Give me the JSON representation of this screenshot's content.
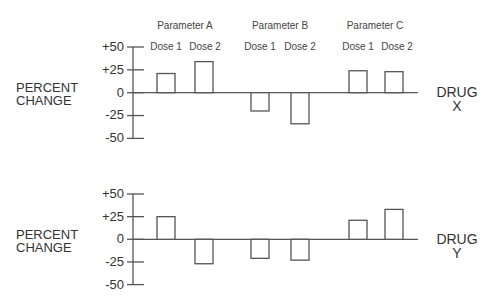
{
  "chart_data": [
    {
      "type": "bar",
      "title": "DRUG X",
      "panel_label": "DRUG\nX",
      "ylabel": "PERCENT\nCHANGE",
      "xlabel": "",
      "groups": [
        "Parameter A",
        "Parameter B",
        "Parameter C"
      ],
      "categories": [
        "Parameter A Dose 1",
        "Parameter A Dose 2",
        "Parameter B Dose 1",
        "Parameter B Dose 2",
        "Parameter C Dose 1",
        "Parameter C Dose 2"
      ],
      "values": [
        21,
        34,
        -20,
        -34,
        24,
        23
      ],
      "ylim": [
        -50,
        50
      ],
      "yticks": [
        "+50",
        "+25",
        "0",
        "-25",
        "-50"
      ],
      "grid": false,
      "legend": null
    },
    {
      "type": "bar",
      "title": "DRUG Y",
      "panel_label": "DRUG\nY",
      "ylabel": "PERCENT\nCHANGE",
      "xlabel": "",
      "groups": [
        "Parameter A",
        "Parameter B",
        "Parameter C"
      ],
      "categories": [
        "Parameter A Dose 1",
        "Parameter A Dose 2",
        "Parameter B Dose 1",
        "Parameter B Dose 2",
        "Parameter C Dose 1",
        "Parameter C Dose 2"
      ],
      "values": [
        25,
        -27,
        -21,
        -23,
        21,
        33
      ],
      "ylim": [
        -50,
        50
      ],
      "yticks": [
        "+50",
        "+25",
        "0",
        "-25",
        "-50"
      ],
      "grid": false,
      "legend": null
    }
  ],
  "header": {
    "params": [
      "Parameter A",
      "Parameter B",
      "Parameter C"
    ],
    "doses": [
      "Dose 1",
      "Dose 2",
      "Dose 1",
      "Dose 2",
      "Dose 1",
      "Dose 2"
    ]
  },
  "panels": [
    {
      "ylabel_line1": "PERCENT",
      "ylabel_line2": "CHANGE",
      "drug_line1": "DRUG",
      "drug_line2": "X",
      "ticks": [
        "+50",
        "+25",
        "0",
        "-25",
        "-50"
      ]
    },
    {
      "ylabel_line1": "PERCENT",
      "ylabel_line2": "CHANGE",
      "drug_line1": "DRUG",
      "drug_line2": "Y",
      "ticks": [
        "+50",
        "+25",
        "0",
        "-25",
        "-50"
      ]
    }
  ],
  "colors": {
    "line": "#555555",
    "bar_fill": "#ffffff",
    "text": "#333333"
  }
}
